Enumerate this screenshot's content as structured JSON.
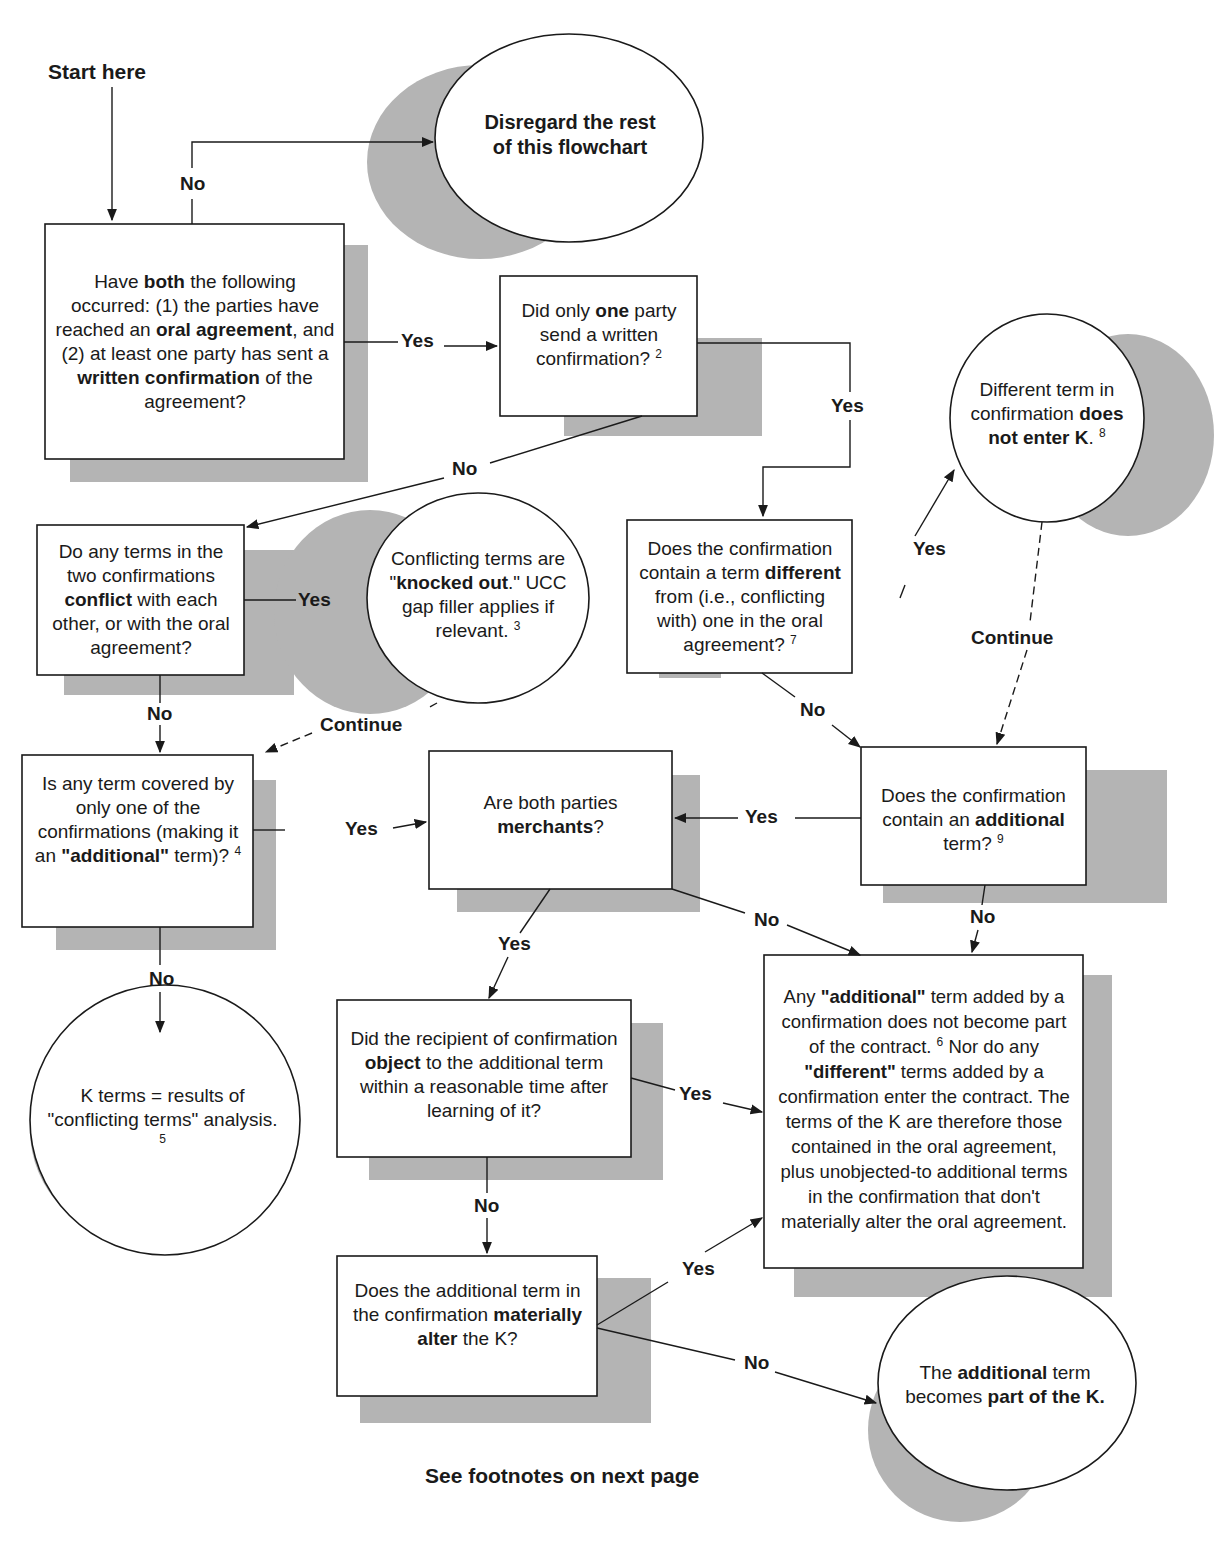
{
  "diagram": {
    "start_label": "Start here",
    "footer_note": "See footnotes on next page",
    "colors": {
      "shadow": "#b4b4b4",
      "line": "#1a1a1a",
      "box_fill": "#ffffff",
      "background": "#ffffff"
    },
    "nodes": {
      "q_oral_written": {
        "shape": "box",
        "segments": [
          {
            "t": "Have "
          },
          {
            "t": "both",
            "b": true
          },
          {
            "t": " the following occurred: (1) the parties have reached an "
          },
          {
            "t": "oral agreement",
            "b": true
          },
          {
            "t": ", and (2) at least one party has sent a "
          },
          {
            "t": "written confirmation",
            "b": true
          },
          {
            "t": " of the agreement?"
          }
        ]
      },
      "end_disregard": {
        "shape": "circle",
        "segments": [
          {
            "t": "Disregard the rest of this flowchart",
            "b": true
          }
        ]
      },
      "q_only_one_party": {
        "shape": "box",
        "segments": [
          {
            "t": "Did only "
          },
          {
            "t": "one",
            "b": true
          },
          {
            "t": " party send a written confirmation? "
          },
          {
            "t": "2",
            "sup": true
          }
        ]
      },
      "end_different_not_enter": {
        "shape": "circle",
        "segments": [
          {
            "t": "Different term in confirmation "
          },
          {
            "t": "does not enter K",
            "b": true
          },
          {
            "t": ". "
          },
          {
            "t": "8",
            "sup": true
          }
        ]
      },
      "q_terms_conflict": {
        "shape": "box",
        "segments": [
          {
            "t": "Do any terms in the two confirmations "
          },
          {
            "t": "conflict",
            "b": true
          },
          {
            "t": " with each other, or with the oral agreement?"
          }
        ]
      },
      "end_knocked_out": {
        "shape": "circle",
        "segments": [
          {
            "t": "Conflicting terms are \""
          },
          {
            "t": "knocked out",
            "b": true
          },
          {
            "t": ".\" UCC gap filler applies if relevant. "
          },
          {
            "t": "3",
            "sup": true
          }
        ]
      },
      "q_term_different": {
        "shape": "box",
        "segments": [
          {
            "t": "Does the confirmation contain a term "
          },
          {
            "t": "different",
            "b": true
          },
          {
            "t": " from (i.e., conflicting with) one in the oral agreement? "
          },
          {
            "t": "7",
            "sup": true
          }
        ]
      },
      "q_additional_only_one": {
        "shape": "box",
        "segments": [
          {
            "t": "Is any term covered by only one of the confirmations (making it an "
          },
          {
            "t": "\"additional\"",
            "b": true
          },
          {
            "t": " term)? "
          },
          {
            "t": "4",
            "sup": true
          }
        ]
      },
      "q_both_merchants": {
        "shape": "box",
        "segments": [
          {
            "t": "Are both parties "
          },
          {
            "t": "merchants",
            "b": true
          },
          {
            "t": "?"
          }
        ]
      },
      "q_contains_additional": {
        "shape": "box",
        "segments": [
          {
            "t": "Does the confirmation contain an "
          },
          {
            "t": "additional",
            "b": true
          },
          {
            "t": " term? "
          },
          {
            "t": "9",
            "sup": true
          }
        ]
      },
      "end_k_terms_conflicting": {
        "shape": "circle",
        "segments": [
          {
            "t": "K terms = results of \"conflicting terms\" analysis. "
          },
          {
            "t": "5",
            "sup": true
          }
        ]
      },
      "q_recipient_object": {
        "shape": "box",
        "segments": [
          {
            "t": "Did the recipient of confirmation "
          },
          {
            "t": "object",
            "b": true
          },
          {
            "t": " to the additional term within a reasonable time after learning of it?"
          }
        ]
      },
      "end_additional_not_part": {
        "shape": "box",
        "segments": [
          {
            "t": "Any "
          },
          {
            "t": "\"additional\"",
            "b": true
          },
          {
            "t": " term added by a confirmation does not become part of the contract. "
          },
          {
            "t": "6",
            "sup": true
          },
          {
            "t": " Nor do any "
          },
          {
            "t": "\"different\"",
            "b": true
          },
          {
            "t": " terms added by a confirmation enter the contract. The terms of the K are therefore those contained in the oral agreement, plus unobjected-to additional terms in the confirmation that don't materially alter the oral agreement."
          }
        ]
      },
      "q_materially_alter": {
        "shape": "box",
        "segments": [
          {
            "t": "Does the additional term in the confirmation "
          },
          {
            "t": "materially alter",
            "b": true
          },
          {
            "t": " the K?"
          }
        ]
      },
      "end_becomes_part": {
        "shape": "circle",
        "segments": [
          {
            "t": "The "
          },
          {
            "t": "additional",
            "b": true
          },
          {
            "t": " term becomes "
          },
          {
            "t": "part of the K.",
            "b": true
          }
        ]
      }
    },
    "edge_labels": {
      "q1_no": "No",
      "q1_yes": "Yes",
      "q_only_one_yes": "Yes",
      "q_only_one_no": "No",
      "q_conflict_yes": "Yes",
      "q_conflict_no": "No",
      "knocked_continue": "Continue",
      "q_different_yes": "Yes",
      "q_different_no": "No",
      "different_continue": "Continue",
      "q_additional_only_yes": "Yes",
      "q_additional_only_no": "No",
      "q_contains_additional_yes": "Yes",
      "q_contains_additional_no": "No",
      "q_merchants_yes": "Yes",
      "q_merchants_no": "No",
      "q_object_yes": "Yes",
      "q_object_no": "No",
      "q_material_yes": "Yes",
      "q_material_no": "No"
    }
  }
}
